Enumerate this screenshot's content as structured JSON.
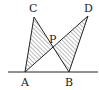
{
  "figure": {
    "type": "geometry-diagram",
    "points": {
      "A": {
        "label": "A",
        "x": 25,
        "y": 72
      },
      "B": {
        "label": "B",
        "x": 69,
        "y": 72
      },
      "C": {
        "label": "C",
        "x": 34,
        "y": 17
      },
      "D": {
        "label": "D",
        "x": 88,
        "y": 16
      },
      "P": {
        "label": "P",
        "x": 53,
        "y": 48
      }
    },
    "segments": [
      "AC",
      "CB",
      "AD",
      "DB",
      "baseline through A and B"
    ],
    "shaded_regions": [
      "triangle ACP",
      "triangle PDB"
    ],
    "colors": {
      "stroke": "#222222",
      "hatch": "#555555",
      "background": "#ffffff"
    }
  }
}
